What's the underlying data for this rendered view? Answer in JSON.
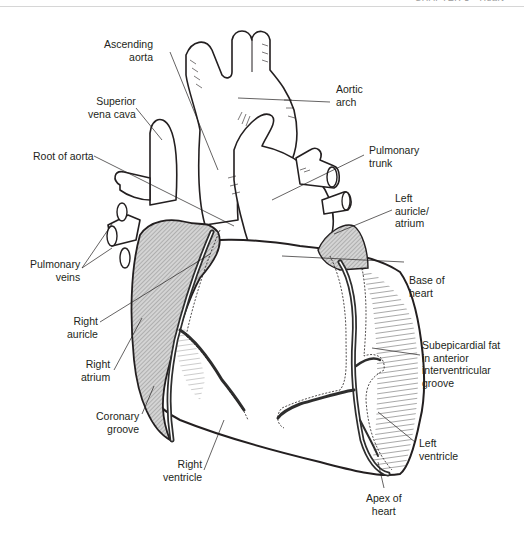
{
  "running_head": {
    "text": "CHAPTER 5 • Heart"
  },
  "figure": {
    "colors": {
      "ink": "#231f20",
      "stipple": "#bfbfbf",
      "vessel": "#3a3a3a",
      "fat": "#f2f2f2"
    },
    "labels": {
      "ascending_aorta": "Ascending\naorta",
      "aortic_arch": "Aortic\narch",
      "superior_vena_cava": "Superior\nvena cava",
      "root_of_aorta": "Root of aorta",
      "pulmonary_trunk": "Pulmonary\ntrunk",
      "left_auricle_atrium": "Left\nauricle/\natrium",
      "pulmonary_veins": "Pulmonary\nveins",
      "base_of_heart": "Base of\nheart",
      "right_auricle": "Right\nauricle",
      "subepicardial_fat": "Subepicardial fat\nin anterior\ninterventricular\ngroove",
      "right_atrium": "Right\natrium",
      "coronary_groove": "Coronary\ngroove",
      "left_ventricle": "Left\nventricle",
      "right_ventricle": "Right\nventricle",
      "apex_of_heart": "Apex of\nheart"
    }
  }
}
